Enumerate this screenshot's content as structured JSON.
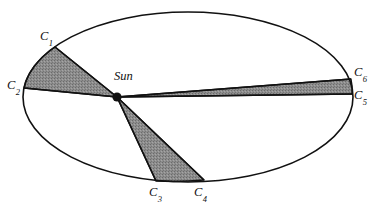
{
  "figure": {
    "type": "orbital-diagram",
    "background_color": "#ffffff",
    "stroke_color": "#111111",
    "sector_fill_color": "#8a8a8a",
    "sector_stroke_color": "#111111"
  },
  "orbit": {
    "name": "orbit-ellipse",
    "center_x": 188,
    "center_y": 97,
    "radius_x": 165,
    "radius_y": 85,
    "stroke_width": 1.6
  },
  "sun": {
    "label": "Sun",
    "x": 117,
    "y": 97,
    "dot_radius": 4.6,
    "label_x": 114,
    "label_y": 70
  },
  "points": [
    {
      "key": "C1",
      "letter": "C",
      "subscript": "1",
      "x": 55,
      "y": 47,
      "label_x": 40,
      "label_y": 30
    },
    {
      "key": "C2",
      "letter": "C",
      "subscript": "2",
      "x": 24,
      "y": 88,
      "label_x": 7,
      "label_y": 79
    },
    {
      "key": "C3",
      "letter": "C",
      "subscript": "3",
      "x": 156,
      "y": 181,
      "label_x": 149,
      "label_y": 186
    },
    {
      "key": "C4",
      "letter": "C",
      "subscript": "4",
      "x": 204,
      "y": 180,
      "label_x": 194,
      "label_y": 186
    },
    {
      "key": "C5",
      "letter": "C",
      "subscript": "5",
      "x": 352,
      "y": 94,
      "label_x": 354,
      "label_y": 89
    },
    {
      "key": "C6",
      "letter": "C",
      "subscript": "6",
      "x": 351,
      "y": 79,
      "label_x": 354,
      "label_y": 66
    }
  ],
  "sectors": [
    {
      "name": "sector-c1-c2",
      "from": "C1",
      "to": "C2",
      "position": "upper-left",
      "path": "M 117 97 L 55 47 A 165 85 0 0 0 24 88 Z"
    },
    {
      "name": "sector-c3-c4",
      "from": "C3",
      "to": "C4",
      "position": "bottom",
      "path": "M 117 97 L 156 181 A 165 85 0 0 0 204 180 Z"
    },
    {
      "name": "sector-c5-c6",
      "from": "C5",
      "to": "C6",
      "position": "right",
      "path": "M 117 97 L 351 79 A 165 85 0 0 1 352 94 Z"
    }
  ],
  "radius_lines": [
    {
      "name": "radius-sun-c1",
      "x1": 117,
      "y1": 97,
      "x2": 55,
      "y2": 47
    },
    {
      "name": "radius-sun-c2",
      "x1": 117,
      "y1": 97,
      "x2": 24,
      "y2": 88
    },
    {
      "name": "radius-sun-c3",
      "x1": 117,
      "y1": 97,
      "x2": 156,
      "y2": 181
    },
    {
      "name": "radius-sun-c4",
      "x1": 117,
      "y1": 97,
      "x2": 204,
      "y2": 180
    },
    {
      "name": "radius-sun-c6",
      "x1": 117,
      "y1": 97,
      "x2": 351,
      "y2": 79
    },
    {
      "name": "radius-sun-c5",
      "x1": 117,
      "y1": 97,
      "x2": 352,
      "y2": 94
    }
  ]
}
